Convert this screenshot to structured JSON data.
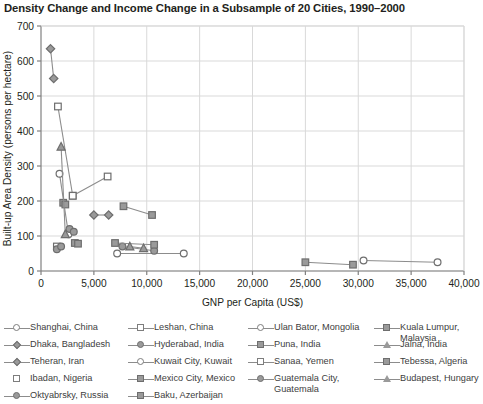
{
  "chart_data": {
    "type": "scatter",
    "title": "Density Change and Income Change in a Subsample of 20 Cities, 1990–2000",
    "xlabel": "GNP per Capita (US$)",
    "ylabel": "Built-up Area Density (persons per hectare)",
    "xlim": [
      0,
      40000
    ],
    "ylim": [
      0,
      700
    ],
    "xticks": [
      0,
      5000,
      10000,
      15000,
      20000,
      25000,
      30000,
      35000,
      40000
    ],
    "xticklabels": [
      "0",
      "5,000",
      "10,000",
      "15,000",
      "20,000",
      "25,000",
      "30,000",
      "35,000",
      "40,000"
    ],
    "yticks": [
      0,
      100,
      200,
      300,
      400,
      500,
      600,
      700
    ],
    "yticklabels": [
      "0",
      "100",
      "200",
      "300",
      "400",
      "500",
      "600",
      "700"
    ],
    "grid": "both",
    "legend_position": "below",
    "note": "Each city is drawn as two markers (1990 and 2000) joined by a line segment.",
    "series": [
      {
        "name": "Shanghai, China",
        "marker": "circle-open",
        "points": [
          [
            1750,
            278
          ],
          [
            2600,
            105
          ]
        ]
      },
      {
        "name": "Dhaka, Bangladesh",
        "marker": "diamond-fill",
        "points": [
          [
            900,
            635
          ],
          [
            1200,
            550
          ]
        ]
      },
      {
        "name": "Teheran, Iran",
        "marker": "diamond-fill",
        "points": [
          [
            5000,
            160
          ],
          [
            6400,
            160
          ]
        ]
      },
      {
        "name": "Ibadan, Nigeria",
        "marker": "square-open",
        "points": [
          [
            1500,
            70
          ]
        ]
      },
      {
        "name": "Oktyabrsky, Russia",
        "marker": "circle-fill",
        "points": [
          [
            1500,
            62
          ],
          [
            1900,
            70
          ]
        ]
      },
      {
        "name": "Leshan, China",
        "marker": "square-open",
        "points": [
          [
            1600,
            470
          ],
          [
            3000,
            215
          ]
        ]
      },
      {
        "name": "Hyderabad, India",
        "marker": "circle-fill",
        "points": [
          [
            2700,
            120
          ],
          [
            3100,
            112
          ]
        ]
      },
      {
        "name": "Kuwait City, Kuwait",
        "marker": "circle-open",
        "points": [
          [
            30500,
            30
          ],
          [
            37500,
            25
          ]
        ]
      },
      {
        "name": "Mexico City, Mexico",
        "marker": "square-fill",
        "points": [
          [
            3200,
            80
          ],
          [
            3500,
            78
          ]
        ]
      },
      {
        "name": "Baku, Azerbaijan",
        "marker": "square-fill",
        "points": [
          [
            2100,
            195
          ],
          [
            2300,
            190
          ]
        ]
      },
      {
        "name": "Ulan Bator, Mongolia",
        "marker": "circle-open",
        "points": [
          [
            7200,
            50
          ],
          [
            13500,
            50
          ]
        ]
      },
      {
        "name": "Puna, India",
        "marker": "square-fill",
        "points": [
          [
            7800,
            185
          ],
          [
            10500,
            160
          ]
        ]
      },
      {
        "name": "Sanaa, Yemen",
        "marker": "square-open",
        "points": [
          [
            3000,
            215
          ],
          [
            6300,
            270
          ]
        ]
      },
      {
        "name": "Guatemala City, Guatemala",
        "marker": "circle-fill",
        "points": [
          [
            7700,
            70
          ],
          [
            10700,
            58
          ]
        ]
      },
      {
        "name": "Kuala Lumpur, Malaysia",
        "marker": "square-fill",
        "points": [
          [
            25000,
            25
          ],
          [
            29500,
            18
          ]
        ]
      },
      {
        "name": "Jalna, India",
        "marker": "triangle",
        "points": [
          [
            1900,
            355
          ],
          [
            2300,
            105
          ]
        ]
      },
      {
        "name": "Tebessa, Algeria",
        "marker": "square-fill",
        "points": [
          [
            7000,
            80
          ],
          [
            10700,
            75
          ]
        ]
      },
      {
        "name": "Budapest, Hungary",
        "marker": "triangle",
        "points": [
          [
            8400,
            70
          ],
          [
            9700,
            65
          ]
        ]
      }
    ]
  },
  "legend": {
    "columns": [
      {
        "left": 4,
        "width": 124,
        "items": [
          {
            "label": "Shanghai, China",
            "marker": "circle-open",
            "line": true
          },
          {
            "label": "Dhaka, Bangladesh",
            "marker": "diamond-fill",
            "line": true
          },
          {
            "label": "Teheran, Iran",
            "marker": "diamond-fill",
            "line": true
          },
          {
            "label": "Ibadan, Nigeria",
            "marker": "square-open",
            "line": false
          },
          {
            "label": "Oktyabrsky, Russia",
            "marker": "circle-fill",
            "line": true
          }
        ]
      },
      {
        "left": 128,
        "width": 124,
        "items": [
          {
            "label": "Leshan, China",
            "marker": "square-open",
            "line": true
          },
          {
            "label": "Hyderabad, India",
            "marker": "circle-fill",
            "line": true
          },
          {
            "label": "Kuwait City, Kuwait",
            "marker": "circle-open",
            "line": true
          },
          {
            "label": "Mexico City, Mexico",
            "marker": "square-fill",
            "line": true
          },
          {
            "label": "Baku, Azerbaijan",
            "marker": "square-fill",
            "line": true
          }
        ]
      },
      {
        "left": 248,
        "width": 126,
        "items": [
          {
            "label": "Ulan Bator, Mongolia",
            "marker": "circle-open",
            "line": true
          },
          {
            "label": "Puna, India",
            "marker": "square-fill",
            "line": true
          },
          {
            "label": "Sanaa, Yemen",
            "marker": "square-open",
            "line": true
          },
          {
            "label": "Guatemala City,\nGuatemala",
            "marker": "circle-fill",
            "line": true
          }
        ]
      },
      {
        "left": 374,
        "width": 108,
        "items": [
          {
            "label": "Kuala Lumpur,\nMalaysia",
            "marker": "square-fill",
            "line": true
          },
          {
            "label": "Jalna, India",
            "marker": "triangle",
            "line": true
          },
          {
            "label": "Tebessa, Algeria",
            "marker": "square-fill",
            "line": true
          },
          {
            "label": "Budapest, Hungary",
            "marker": "triangle",
            "line": true
          }
        ]
      }
    ]
  },
  "colors": {
    "marker_stroke": "#6e6e6e",
    "marker_fill": "#9a9a9a",
    "line": "#8c8c8c",
    "grid": "#d9d9d9",
    "axis": "#808080",
    "text": "#231f20"
  }
}
